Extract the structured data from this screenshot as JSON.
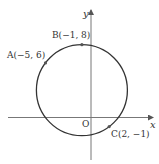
{
  "diagram": {
    "type": "circle-through-three-points",
    "axes": {
      "x_label": "x",
      "y_label": "y",
      "origin_label": "O"
    },
    "circle": {
      "center": [
        -1,
        3
      ],
      "radius": 5
    },
    "points": [
      {
        "name": "A",
        "label": "A(−5, 6)",
        "x": -5,
        "y": 6
      },
      {
        "name": "B",
        "label": "B(−1, 8)",
        "x": -1,
        "y": 8
      },
      {
        "name": "C",
        "label": "C(2, −1)",
        "x": 2,
        "y": -1
      }
    ],
    "colors": {
      "stroke": "#333333",
      "axis": "#555555",
      "point": "#555555"
    }
  }
}
